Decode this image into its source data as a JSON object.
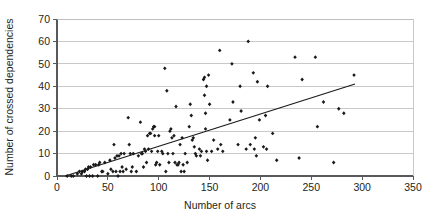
{
  "chart_data": {
    "type": "scatter",
    "title": "",
    "subtitle": "",
    "xlabel": "Number of arcs",
    "ylabel": "Number of crossed dependencies",
    "xlim": [
      0,
      350
    ],
    "ylim": [
      0,
      70
    ],
    "xticks": [
      0,
      50,
      100,
      150,
      200,
      250,
      300,
      350
    ],
    "yticks": [
      0,
      10,
      20,
      30,
      40,
      50,
      60,
      70
    ],
    "xtick_labels": [
      "0",
      "50",
      "100",
      "150",
      "200",
      "250",
      "300",
      "350"
    ],
    "ytick_labels": [
      "0",
      "10",
      "20",
      "30",
      "40",
      "50",
      "60",
      "70"
    ],
    "grid": "horizontal",
    "legend": "none",
    "marker": "filled-diamond",
    "marker_color": "#1a1a1a",
    "series": [
      {
        "name": "crossed dependencies vs arcs",
        "points": [
          [
            10,
            0
          ],
          [
            14,
            0
          ],
          [
            16,
            0
          ],
          [
            20,
            1
          ],
          [
            22,
            2
          ],
          [
            24,
            1
          ],
          [
            25,
            2
          ],
          [
            27,
            2
          ],
          [
            28,
            3
          ],
          [
            29,
            0
          ],
          [
            30,
            3
          ],
          [
            31,
            4
          ],
          [
            32,
            0
          ],
          [
            33,
            4
          ],
          [
            35,
            0
          ],
          [
            36,
            5
          ],
          [
            38,
            5
          ],
          [
            40,
            0
          ],
          [
            41,
            5
          ],
          [
            42,
            6
          ],
          [
            44,
            2
          ],
          [
            45,
            2
          ],
          [
            47,
            6
          ],
          [
            50,
            1
          ],
          [
            52,
            7
          ],
          [
            53,
            3
          ],
          [
            55,
            2
          ],
          [
            56,
            14
          ],
          [
            57,
            8
          ],
          [
            58,
            2
          ],
          [
            59,
            9
          ],
          [
            60,
            0
          ],
          [
            61,
            9
          ],
          [
            62,
            2
          ],
          [
            63,
            10
          ],
          [
            64,
            4
          ],
          [
            65,
            2
          ],
          [
            66,
            10
          ],
          [
            68,
            3
          ],
          [
            70,
            26
          ],
          [
            71,
            14
          ],
          [
            72,
            10
          ],
          [
            73,
            2
          ],
          [
            74,
            4
          ],
          [
            75,
            10
          ],
          [
            78,
            2
          ],
          [
            80,
            9
          ],
          [
            82,
            24
          ],
          [
            83,
            10
          ],
          [
            84,
            10
          ],
          [
            85,
            4
          ],
          [
            86,
            12
          ],
          [
            87,
            11
          ],
          [
            88,
            6
          ],
          [
            89,
            18
          ],
          [
            90,
            12
          ],
          [
            91,
            19
          ],
          [
            92,
            19
          ],
          [
            93,
            11
          ],
          [
            94,
            21
          ],
          [
            95,
            22
          ],
          [
            96,
            22
          ],
          [
            96,
            18
          ],
          [
            97,
            5
          ],
          [
            98,
            6
          ],
          [
            99,
            11
          ],
          [
            100,
            18
          ],
          [
            101,
            5
          ],
          [
            103,
            11
          ],
          [
            104,
            10
          ],
          [
            106,
            48
          ],
          [
            107,
            2
          ],
          [
            108,
            38
          ],
          [
            109,
            10
          ],
          [
            110,
            6
          ],
          [
            111,
            20
          ],
          [
            112,
            21
          ],
          [
            113,
            17
          ],
          [
            114,
            10
          ],
          [
            115,
            18
          ],
          [
            116,
            6
          ],
          [
            117,
            31
          ],
          [
            118,
            5
          ],
          [
            119,
            5
          ],
          [
            120,
            6
          ],
          [
            121,
            14
          ],
          [
            122,
            2
          ],
          [
            123,
            17
          ],
          [
            124,
            5
          ],
          [
            125,
            2
          ],
          [
            126,
            10
          ],
          [
            128,
            6
          ],
          [
            130,
            22
          ],
          [
            131,
            32
          ],
          [
            132,
            27
          ],
          [
            133,
            16
          ],
          [
            134,
            17
          ],
          [
            135,
            13
          ],
          [
            136,
            10
          ],
          [
            137,
            9
          ],
          [
            140,
            12
          ],
          [
            141,
            9
          ],
          [
            142,
            11
          ],
          [
            144,
            43
          ],
          [
            145,
            44
          ],
          [
            145,
            36
          ],
          [
            146,
            28
          ],
          [
            146,
            21
          ],
          [
            147,
            40
          ],
          [
            147,
            11
          ],
          [
            148,
            7
          ],
          [
            149,
            45
          ],
          [
            150,
            32
          ],
          [
            152,
            11
          ],
          [
            154,
            16
          ],
          [
            158,
            12
          ],
          [
            160,
            56
          ],
          [
            161,
            14
          ],
          [
            163,
            11
          ],
          [
            170,
            25
          ],
          [
            172,
            50
          ],
          [
            173,
            33
          ],
          [
            178,
            14
          ],
          [
            180,
            40
          ],
          [
            181,
            29
          ],
          [
            186,
            12
          ],
          [
            188,
            60
          ],
          [
            190,
            14
          ],
          [
            193,
            46
          ],
          [
            194,
            12
          ],
          [
            195,
            17
          ],
          [
            196,
            9
          ],
          [
            197,
            42
          ],
          [
            199,
            25
          ],
          [
            203,
            13
          ],
          [
            205,
            27
          ],
          [
            206,
            12
          ],
          [
            207,
            40
          ],
          [
            212,
            19
          ],
          [
            216,
            7
          ],
          [
            234,
            53
          ],
          [
            238,
            8
          ],
          [
            241,
            43
          ],
          [
            254,
            53
          ],
          [
            256,
            22
          ],
          [
            262,
            33
          ],
          [
            272,
            6
          ],
          [
            277,
            30
          ],
          [
            282,
            28
          ],
          [
            292,
            45
          ]
        ]
      }
    ],
    "trendline": {
      "name": "linear fit",
      "x_start": 8,
      "y_start": 0,
      "x_end": 293,
      "y_end": 41,
      "color": "#1a1a1a"
    }
  },
  "axes": {
    "y_title": "Number of crossed dependencies",
    "x_title": "Number of arcs"
  }
}
